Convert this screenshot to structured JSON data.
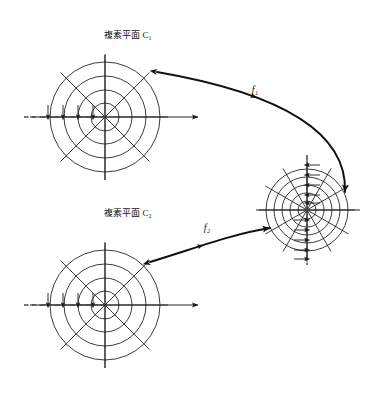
{
  "figure": {
    "title_top": "複素平面 C₁",
    "title_bottom": "複素平面 C₂",
    "map_label_1": "f₁",
    "map_label_2": "f₂",
    "background_color": "#ffffff",
    "line_color": "#1a1a1a",
    "dash_color": "#4a4a4a",
    "canvas": {
      "width": 380,
      "height": 403
    }
  },
  "planes": [
    {
      "id": "plane-c1",
      "label": "複素平面 C₁",
      "label_x": 128,
      "label_y": 38,
      "center_x": 105,
      "center_y": 117,
      "radii": [
        14,
        27,
        41,
        55
      ],
      "circle_count": 4,
      "spoke_count": 8,
      "spoke_angles_deg": [
        0,
        45,
        90,
        135,
        180,
        225,
        270,
        315
      ],
      "spoke_length": 63,
      "axis": {
        "real_left": 30,
        "real_right": 198,
        "imag_top": 55,
        "imag_bottom": 180,
        "arrow_on": "real-positive"
      },
      "branch_cut": {
        "orientation": "horizontal",
        "from_x": 24,
        "to_x": 105,
        "y": 117,
        "style": "dashed",
        "crossing_arrows": 4,
        "arrow_direction": "down",
        "arrow_x_positions": [
          48,
          63,
          78,
          93
        ]
      }
    },
    {
      "id": "plane-c2",
      "label": "複素平面 C₂",
      "label_x": 128,
      "label_y": 216,
      "center_x": 105,
      "center_y": 305,
      "radii": [
        14,
        27,
        41,
        55
      ],
      "circle_count": 4,
      "spoke_count": 8,
      "spoke_angles_deg": [
        0,
        45,
        90,
        135,
        180,
        225,
        270,
        315
      ],
      "spoke_length": 63,
      "axis": {
        "real_left": 30,
        "real_right": 198,
        "imag_top": 243,
        "imag_bottom": 368,
        "arrow_on": "real-positive"
      },
      "branch_cut": {
        "orientation": "horizontal",
        "from_x": 24,
        "to_x": 105,
        "y": 305,
        "style": "dashed",
        "crossing_arrows": 4,
        "arrow_direction": "down",
        "arrow_x_positions": [
          48,
          63,
          78,
          93
        ]
      }
    },
    {
      "id": "plane-image",
      "label": "",
      "center_x": 307,
      "center_y": 210,
      "radii": [
        9,
        17,
        25,
        33,
        41
      ],
      "circle_count": 5,
      "spoke_count": 12,
      "spoke_angles_deg": [
        0,
        30,
        60,
        90,
        120,
        150,
        180,
        210,
        240,
        270,
        300,
        330
      ],
      "spoke_length": 48,
      "axis": {
        "real_left": 256,
        "real_right": 360,
        "imag_top": 158,
        "imag_bottom": 262,
        "arrow_on": "none"
      },
      "branch_cut": {
        "orientation": "vertical",
        "from_y": 155,
        "to_y": 265,
        "x": 307,
        "style": "dashed",
        "crossing_arrows_upper": 5,
        "crossing_arrows_lower": 5,
        "arrow_direction_upper": "left",
        "arrow_direction_lower": "right",
        "arrow_y_positions_upper": [
          165,
          175,
          185,
          195,
          203
        ],
        "arrow_y_positions_lower": [
          220,
          230,
          240,
          250,
          259
        ]
      }
    }
  ],
  "maps": [
    {
      "id": "map-f1",
      "label": "f₁",
      "label_x": 255,
      "label_y": 93,
      "from_plane": "plane-c1",
      "to_plane": "plane-image",
      "start_x": 157,
      "start_y": 72,
      "end_x": 345,
      "end_y": 192,
      "control_1_x": 250,
      "control_1_y": 88,
      "control_2_x": 348,
      "control_2_y": 120,
      "arrowheads_on_path": 2,
      "direction": "left-to-right"
    },
    {
      "id": "map-f2",
      "label": "f₂",
      "label_x": 207,
      "label_y": 231,
      "from_plane": "plane-c2",
      "to_plane": "plane-image",
      "start_x": 150,
      "start_y": 262,
      "end_x": 270,
      "end_y": 228,
      "control_1_x": 196,
      "control_1_y": 248,
      "control_2_x": 232,
      "control_2_y": 234,
      "arrowheads_on_path": 2,
      "direction": "left-to-right"
    }
  ]
}
